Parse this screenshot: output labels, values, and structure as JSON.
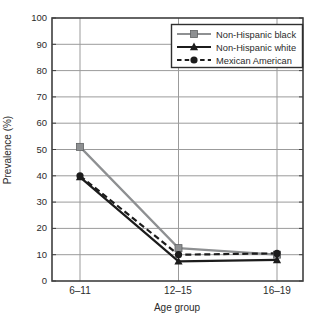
{
  "chart_data": {
    "type": "line",
    "title": "",
    "xlabel": "Age group",
    "ylabel": "Prevalence (%)",
    "categories": [
      "6–11",
      "12–15",
      "16–19"
    ],
    "yticks": [
      0,
      10,
      20,
      30,
      40,
      50,
      60,
      70,
      80,
      90,
      100
    ],
    "ylim": [
      0,
      100
    ],
    "grid": true,
    "legend_position": "top-right",
    "series": [
      {
        "name": "Non-Hispanic black",
        "values": [
          51,
          12.5,
          10
        ],
        "color": "#8e9092",
        "line_style": "solid",
        "marker": "square"
      },
      {
        "name": "Non-Hispanic white",
        "values": [
          39.5,
          7.5,
          8
        ],
        "color": "#1c1c1c",
        "line_style": "solid",
        "marker": "triangle"
      },
      {
        "name": "Mexican American",
        "values": [
          40,
          10,
          10.5
        ],
        "color": "#1c1c1c",
        "line_style": "dashed",
        "marker": "circle"
      }
    ]
  }
}
